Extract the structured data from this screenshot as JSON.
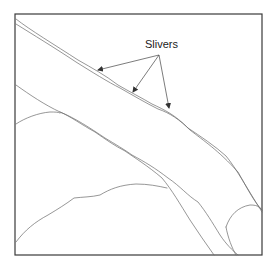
{
  "diagram": {
    "annotation": {
      "label": "Slivers",
      "color": "#222222"
    },
    "arrow_origin": [
      159,
      55
    ],
    "arrow_targets": [
      [
        98,
        70
      ],
      [
        133,
        92
      ],
      [
        169,
        108
      ]
    ],
    "frame": {
      "x": 15,
      "y": 14,
      "width": 247,
      "height": 241
    },
    "line_color": "#6a6a6a"
  }
}
